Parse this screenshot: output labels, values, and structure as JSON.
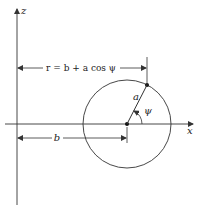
{
  "diagram": {
    "axes": {
      "z_label": "z",
      "x_label": "x"
    },
    "labels": {
      "r_equation": "r = b + a cos ψ",
      "a": "a",
      "b": "b",
      "psi": "ψ"
    },
    "colors": {
      "stroke": "#333333",
      "background": "#ffffff"
    }
  }
}
